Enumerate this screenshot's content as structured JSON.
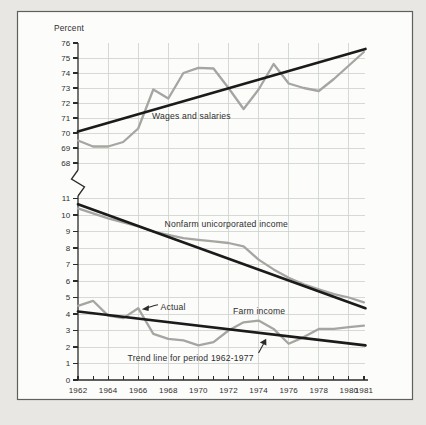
{
  "page": {
    "background": "#e8e7e4"
  },
  "frame": {
    "border_color": "#5f5f5d",
    "background": "#fcfcfa"
  },
  "chart_data": {
    "type": "line",
    "title": "Percent",
    "years": [
      1962,
      1963,
      1964,
      1965,
      1966,
      1967,
      1968,
      1969,
      1970,
      1971,
      1972,
      1973,
      1974,
      1975,
      1976,
      1977,
      1978,
      1979,
      1980,
      1981
    ],
    "x_tick_label_years": [
      1962,
      1964,
      1966,
      1968,
      1970,
      1972,
      1974,
      1976,
      1978,
      1980,
      1981
    ],
    "grid_years": [
      1964,
      1966,
      1968,
      1970,
      1972,
      1974,
      1976,
      1978,
      1980
    ],
    "upper_ticks": [
      76,
      75,
      74,
      73,
      72,
      71,
      70,
      69,
      68
    ],
    "lower_ticks": [
      11,
      10,
      9,
      8,
      7,
      6,
      5,
      4,
      3,
      2,
      1,
      0
    ],
    "upper_ylim": [
      68,
      76
    ],
    "lower_ylim": [
      0,
      11
    ],
    "grid": true,
    "legend_position": "none",
    "axis_break": true,
    "panels": [
      {
        "id": "wages",
        "section": "upper",
        "label": "Wages and salaries",
        "actual": [
          69.5,
          69.1,
          69.1,
          69.4,
          70.3,
          72.9,
          72.3,
          74.0,
          74.35,
          74.3,
          73.0,
          71.6,
          72.9,
          74.6,
          73.3,
          73.0,
          72.8,
          73.6,
          74.5,
          75.4
        ],
        "trend_start": 70.1,
        "trend_end": 75.6
      },
      {
        "id": "nonfarm",
        "section": "lower",
        "label": "Nonfarm unicorporated income",
        "actual": [
          10.4,
          10.1,
          9.8,
          9.55,
          9.3,
          9.0,
          8.8,
          8.6,
          8.5,
          8.4,
          8.3,
          8.1,
          7.3,
          6.7,
          6.2,
          5.8,
          5.5,
          5.2,
          5.0,
          4.7
        ],
        "trend_start": 10.65,
        "trend_end": 4.35
      },
      {
        "id": "farm",
        "section": "lower",
        "label": "Farm income",
        "actual": [
          4.5,
          4.8,
          3.9,
          3.75,
          4.35,
          2.8,
          2.5,
          2.4,
          2.1,
          2.3,
          3.0,
          3.5,
          3.6,
          3.1,
          2.2,
          2.6,
          3.1,
          3.1,
          3.2,
          3.3
        ],
        "trend_start": 4.15,
        "trend_end": 2.1
      }
    ],
    "annotations": [
      {
        "id": "actual",
        "text": "Actual"
      },
      {
        "id": "trend",
        "text": "Trend line for period 1962-1977"
      }
    ],
    "trend_period": "1962-1977",
    "line_colors": {
      "actual": "#a5a5a2",
      "trend": "#1b1b1b"
    },
    "grid_color": "#cbd1cb",
    "axis_color": "#2b2b2b",
    "text_color": "#2e2e2e"
  }
}
